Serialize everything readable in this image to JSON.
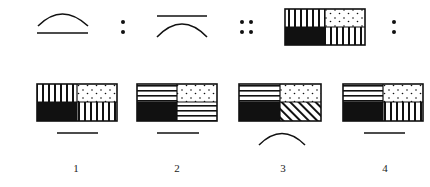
{
  "puzzle": {
    "type": "figural-analogy",
    "stem": [
      {
        "figure": "arc-above-line"
      },
      {
        "relation": "colon"
      },
      {
        "figure": "line-above-arc"
      },
      {
        "relation": "double-colon"
      },
      {
        "figure": "quad-box",
        "cells": {
          "top_left": "vertical-stripes",
          "top_right": "dots",
          "bottom_left": "solid-black",
          "bottom_right": "vertical-stripes"
        }
      },
      {
        "relation": "colon"
      }
    ],
    "options": [
      {
        "label": "1",
        "cells": {
          "top_left": "vertical-stripes",
          "top_right": "dots",
          "bottom_left": "solid-black",
          "bottom_right": "vertical-stripes"
        },
        "below": "line"
      },
      {
        "label": "2",
        "cells": {
          "top_left": "horizontal-stripes",
          "top_right": "dots",
          "bottom_left": "solid-black",
          "bottom_right": "horizontal-stripes"
        },
        "below": "line"
      },
      {
        "label": "3",
        "cells": {
          "top_left": "horizontal-stripes",
          "top_right": "dots",
          "bottom_left": "solid-black",
          "bottom_right": "diagonal-stripes"
        },
        "below": "arc"
      },
      {
        "label": "4",
        "cells": {
          "top_left": "horizontal-stripes",
          "top_right": "dots",
          "bottom_left": "solid-black",
          "bottom_right": "vertical-stripes"
        },
        "below": "line"
      }
    ]
  },
  "colors": {
    "ink": "#111111",
    "background": "#ffffff"
  }
}
